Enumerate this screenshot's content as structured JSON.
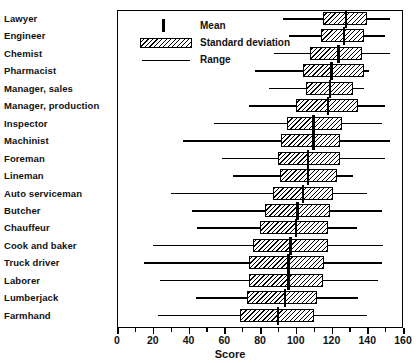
{
  "chart_data": {
    "type": "bar",
    "subtype": "box-whisker-range-mean-sd",
    "title": "",
    "xlabel": "Score",
    "ylabel": "",
    "xlim": [
      0,
      160
    ],
    "xticks": [
      0,
      20,
      40,
      60,
      80,
      100,
      120,
      140,
      160
    ],
    "minor_tick_step": 10,
    "grid": false,
    "legend_position": "upper-left-inside",
    "legend": [
      {
        "key": "mean",
        "label": "Mean",
        "glyph": "vertical-bar"
      },
      {
        "key": "sd",
        "label": "Standard deviation",
        "glyph": "hatched-box"
      },
      {
        "key": "range",
        "label": "Range",
        "glyph": "horizontal-line"
      }
    ],
    "categories": [
      "Lawyer",
      "Engineer",
      "Chemist",
      "Pharmacist",
      "Manager, sales",
      "Manager, production",
      "Inspector",
      "Machinist",
      "Foreman",
      "Lineman",
      "Auto serviceman",
      "Butcher",
      "Chauffeur",
      "Cook and baker",
      "Truck driver",
      "Laborer",
      "Lumberjack",
      "Farmhand"
    ],
    "series": [
      {
        "name": "Lawyer",
        "range_min": 93,
        "sd_low": 115,
        "mean": 128,
        "sd_high": 140,
        "range_max": 153
      },
      {
        "name": "Engineer",
        "range_min": 96,
        "sd_low": 114,
        "mean": 127,
        "sd_high": 138,
        "range_max": 150
      },
      {
        "name": "Chemist",
        "range_min": 88,
        "sd_low": 108,
        "mean": 124,
        "sd_high": 137,
        "range_max": 153
      },
      {
        "name": "Pharmacist",
        "range_min": 77,
        "sd_low": 104,
        "mean": 120,
        "sd_high": 138,
        "range_max": 141
      },
      {
        "name": "Manager, sales",
        "range_min": 85,
        "sd_low": 106,
        "mean": 119,
        "sd_high": 132,
        "range_max": 138
      },
      {
        "name": "Manager, production",
        "range_min": 74,
        "sd_low": 100,
        "mean": 118,
        "sd_high": 135,
        "range_max": 150
      },
      {
        "name": "Inspector",
        "range_min": 54,
        "sd_low": 95,
        "mean": 110,
        "sd_high": 126,
        "range_max": 148
      },
      {
        "name": "Machinist",
        "range_min": 37,
        "sd_low": 92,
        "mean": 110,
        "sd_high": 125,
        "range_max": 153
      },
      {
        "name": "Foreman",
        "range_min": 59,
        "sd_low": 90,
        "mean": 107,
        "sd_high": 125,
        "range_max": 150
      },
      {
        "name": "Lineman",
        "range_min": 65,
        "sd_low": 91,
        "mean": 107,
        "sd_high": 123,
        "range_max": 132
      },
      {
        "name": "Auto serviceman",
        "range_min": 30,
        "sd_low": 87,
        "mean": 104,
        "sd_high": 121,
        "range_max": 140
      },
      {
        "name": "Butcher",
        "range_min": 42,
        "sd_low": 83,
        "mean": 101,
        "sd_high": 119,
        "range_max": 148
      },
      {
        "name": "Chauffeur",
        "range_min": 45,
        "sd_low": 80,
        "mean": 100,
        "sd_high": 118,
        "range_max": 134
      },
      {
        "name": "Cook and baker",
        "range_min": 20,
        "sd_low": 76,
        "mean": 97,
        "sd_high": 118,
        "range_max": 149
      },
      {
        "name": "Truck driver",
        "range_min": 15,
        "sd_low": 74,
        "mean": 96,
        "sd_high": 116,
        "range_max": 148
      },
      {
        "name": "Laborer",
        "range_min": 24,
        "sd_low": 74,
        "mean": 96,
        "sd_high": 115,
        "range_max": 146
      },
      {
        "name": "Lumberjack",
        "range_min": 44,
        "sd_low": 73,
        "mean": 94,
        "sd_high": 112,
        "range_max": 135
      },
      {
        "name": "Farmhand",
        "range_min": 23,
        "sd_low": 69,
        "mean": 90,
        "sd_high": 110,
        "range_max": 140
      }
    ]
  },
  "colors": {
    "ink": "#000000",
    "paper": "#ffffff"
  }
}
